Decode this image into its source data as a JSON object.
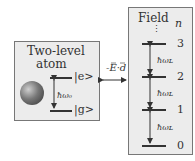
{
  "atom": {
    "title_line1": "Two-level",
    "title_line2": "atom",
    "excited_label": "|e>",
    "ground_label": "|g>",
    "transition_label": "ħω₀"
  },
  "coupling": {
    "label": "-E·d"
  },
  "field": {
    "title": "Field",
    "n_header": "n",
    "dots": "⋮",
    "levels": [
      "3",
      "2",
      "1",
      "0"
    ],
    "spacing_label": "ħωʟ"
  },
  "colors": {
    "box_fill": "#ececec",
    "line": "#333333",
    "sphere": "#555555"
  }
}
